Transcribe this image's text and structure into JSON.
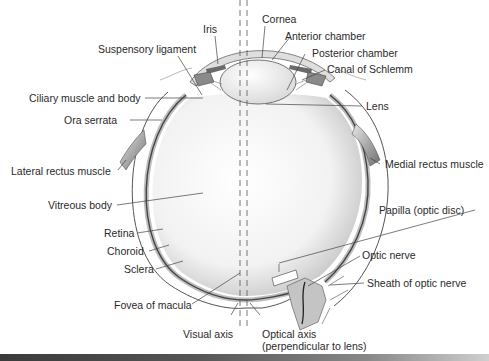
{
  "diagram": {
    "labels": {
      "iris": "Iris",
      "cornea": "Cornea",
      "anterior_chamber": "Anterior chamber",
      "suspensory_ligament": "Suspensory ligament",
      "posterior_chamber": "Posterior chamber",
      "canal_of_schlemm": "Canal of Schlemm",
      "ciliary_muscle": "Ciliary muscle and body",
      "lens": "Lens",
      "ora_serrata": "Ora serrata",
      "lateral_rectus": "Lateral rectus muscle",
      "medial_rectus": "Medial rectus muscle",
      "vitreous_body": "Vitreous body",
      "papilla": "Papilla (optic disc)",
      "retina": "Retina",
      "optic_nerve": "Optic nerve",
      "choroid": "Choroid",
      "sheath": "Sheath of optic nerve",
      "sclera": "Sclera",
      "fovea": "Fovea of macula",
      "visual_axis": "Visual axis",
      "optical_axis_1": "Optical axis",
      "optical_axis_2": "(perpendicular to lens)"
    },
    "colors": {
      "line": "#3a3a3a",
      "tissue_gray": "#b8b8b8",
      "nerve_gray": "#c4c4c4",
      "vitreous_light": "#ffffff",
      "vitreous_shade": "#cfcfcf"
    }
  }
}
